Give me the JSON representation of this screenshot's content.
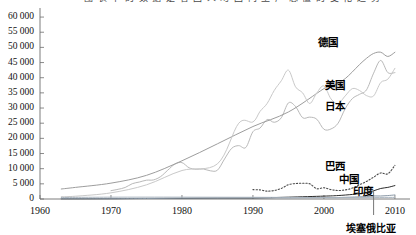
{
  "header": {
    "clipped_caption": "图  表  中  的  数  据  是  各  国  人  均  国  内  生  产  总  值  的  变  化  趋  势"
  },
  "chart_data": {
    "type": "line",
    "title": "",
    "xlabel": "",
    "ylabel": "",
    "xlim": [
      1960,
      2011
    ],
    "ylim": [
      0,
      62000
    ],
    "grid": false,
    "legend_position": "inline-right",
    "y_ticks": [
      "0",
      "5 000",
      "10 000",
      "15 000",
      "20 000",
      "25 000",
      "30 000",
      "35 000",
      "40 000",
      "45 000",
      "50 000",
      "55 000",
      "60 000"
    ],
    "y_tick_values": [
      0,
      5000,
      10000,
      15000,
      20000,
      25000,
      30000,
      35000,
      40000,
      45000,
      50000,
      55000,
      60000
    ],
    "x_ticks": [
      "1960",
      "1970",
      "1980",
      "1990",
      "2000",
      "2010"
    ],
    "x_tick_values": [
      1960,
      1970,
      1980,
      1990,
      2000,
      2010
    ],
    "annotations": [
      {
        "label": "埃塞俄比亚",
        "x": 2007,
        "type": "vertical-marker"
      }
    ],
    "series": [
      {
        "name": "德国",
        "color": "#b9b9b9",
        "style": "solid",
        "label_x": 2000,
        "label_y": 52000,
        "x": [
          1970,
          1971,
          1972,
          1973,
          1974,
          1975,
          1976,
          1977,
          1978,
          1979,
          1980,
          1981,
          1982,
          1983,
          1984,
          1985,
          1986,
          1987,
          1988,
          1989,
          1990,
          1991,
          1992,
          1993,
          1994,
          1995,
          1996,
          1997,
          1998,
          1999,
          2000,
          2001,
          2002,
          2003,
          2004,
          2005,
          2006,
          2007,
          2008,
          2009,
          2010
        ],
        "values": [
          2750,
          3200,
          3800,
          5050,
          5600,
          6200,
          6300,
          7400,
          9500,
          11500,
          12000,
          10300,
          9800,
          9900,
          9300,
          9500,
          13200,
          16700,
          17600,
          17000,
          22200,
          23400,
          26200,
          25300,
          26800,
          31700,
          30500,
          26800,
          27000,
          26300,
          23000,
          23100,
          25000,
          29800,
          33100,
          34500,
          36000,
          41500,
          45700,
          41700,
          41700
        ]
      },
      {
        "name": "美国",
        "color": "#9d9d9d",
        "style": "solid",
        "label_x": 2001,
        "label_y": 38000,
        "x": [
          1963,
          1965,
          1970,
          1975,
          1980,
          1985,
          1990,
          1995,
          2000,
          2001,
          2002,
          2003,
          2004,
          2005,
          2006,
          2007,
          2008,
          2009,
          2010
        ],
        "values": [
          3300,
          3830,
          5230,
          7800,
          12600,
          18200,
          23900,
          28700,
          36400,
          37200,
          38200,
          39700,
          41900,
          44300,
          46400,
          48000,
          48400,
          47000,
          48400
        ]
      },
      {
        "name": "日本",
        "color": "#c9c9c9",
        "style": "solid",
        "label_x": 2001,
        "label_y": 31000,
        "x": [
          1963,
          1965,
          1970,
          1975,
          1980,
          1985,
          1988,
          1990,
          1991,
          1992,
          1993,
          1994,
          1995,
          1996,
          1997,
          1998,
          1999,
          2000,
          2001,
          2002,
          2003,
          2004,
          2005,
          2006,
          2007,
          2008,
          2009,
          2010
        ],
        "values": [
          750,
          920,
          2030,
          4670,
          9400,
          11600,
          25000,
          25400,
          28900,
          31500,
          35800,
          39000,
          42500,
          37000,
          35000,
          31500,
          35000,
          37300,
          33000,
          31500,
          34000,
          36400,
          35800,
          34100,
          34000,
          38400,
          39500,
          43100
        ]
      },
      {
        "name": "巴西",
        "color": "#4a4a4a",
        "style": "dotted",
        "label_x": 2001,
        "label_y": 11200,
        "x": [
          1990,
          1991,
          1992,
          1993,
          1994,
          1995,
          1996,
          1997,
          1998,
          1999,
          2000,
          2001,
          2002,
          2003,
          2004,
          2005,
          2006,
          2007,
          2008,
          2009,
          2010
        ],
        "values": [
          3100,
          3000,
          2600,
          2800,
          3500,
          4700,
          5100,
          5200,
          5000,
          3400,
          3700,
          3100,
          2800,
          3000,
          3600,
          4700,
          5800,
          7200,
          8600,
          8300,
          11100
        ]
      },
      {
        "name": "中国",
        "color": "#2b2b2b",
        "style": "solid",
        "label_x": 2003,
        "label_y": 7000,
        "x": [
          1963,
          1970,
          1975,
          1980,
          1985,
          1990,
          1995,
          2000,
          2002,
          2004,
          2005,
          2006,
          2007,
          2008,
          2009,
          2010
        ],
        "values": [
          75,
          115,
          180,
          195,
          295,
          320,
          600,
          950,
          1140,
          1500,
          1750,
          2100,
          2700,
          3470,
          3830,
          4430
        ]
      },
      {
        "name": "印度",
        "color": "#8c9aa8",
        "style": "solid",
        "label_x": 2005,
        "label_y": 3100,
        "x": [
          1963,
          1970,
          1975,
          1980,
          1985,
          1990,
          1995,
          2000,
          2002,
          2004,
          2005,
          2006,
          2007,
          2008,
          2009,
          2010
        ],
        "values": [
          100,
          110,
          160,
          270,
          300,
          370,
          370,
          450,
          480,
          630,
          710,
          800,
          1020,
          1000,
          1130,
          1340
        ]
      },
      {
        "name": "埃塞俄比亚",
        "color": "#a9b4bf",
        "style": "solid",
        "label_x": 0,
        "label_y": 0,
        "x": [
          1963,
          1970,
          1980,
          1990,
          2000,
          2005,
          2010
        ],
        "values": [
          500,
          600,
          610,
          560,
          480,
          520,
          540
        ]
      }
    ]
  }
}
